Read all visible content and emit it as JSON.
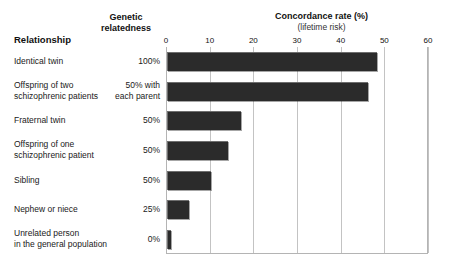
{
  "headers": {
    "relationship": "Relationship",
    "genetic_line1": "Genetic",
    "genetic_line2": "relatedness",
    "concordance_title": "Concordance rate (%)",
    "concordance_sub": "(lifetime risk)"
  },
  "axis": {
    "ticks": [
      "0",
      "10",
      "20",
      "30",
      "40",
      "50",
      "60"
    ],
    "min": 0,
    "max": 60
  },
  "rows": [
    {
      "label_line1": "Identical twin",
      "label_line2": "",
      "relatedness_line1": "100%",
      "relatedness_line2": "",
      "value": 48
    },
    {
      "label_line1": "Offspring of two",
      "label_line2": "schizophrenic patients",
      "relatedness_line1": "50% with",
      "relatedness_line2": "each parent",
      "value": 46
    },
    {
      "label_line1": "Fraternal twin",
      "label_line2": "",
      "relatedness_line1": "50%",
      "relatedness_line2": "",
      "value": 17
    },
    {
      "label_line1": "Offspring of one",
      "label_line2": "schizophrenic patient",
      "relatedness_line1": "50%",
      "relatedness_line2": "",
      "value": 14
    },
    {
      "label_line1": "Sibling",
      "label_line2": "",
      "relatedness_line1": "50%",
      "relatedness_line2": "",
      "value": 10
    },
    {
      "label_line1": "Nephew or niece",
      "label_line2": "",
      "relatedness_line1": "25%",
      "relatedness_line2": "",
      "value": 5
    },
    {
      "label_line1": "Unrelated person",
      "label_line2": "in the general population",
      "relatedness_line1": "0%",
      "relatedness_line2": "",
      "value": 1
    }
  ],
  "colors": {
    "bar": "#2b2b2b",
    "grid": "#c3c3c3",
    "frame": "#b4b4b4",
    "text": "#1a1a1a",
    "background": "#ffffff"
  },
  "chart_data": {
    "type": "bar",
    "orientation": "horizontal",
    "title": "Concordance rate (%)",
    "subtitle": "(lifetime risk)",
    "xlabel": "Concordance rate (%)",
    "ylabel": "Relationship",
    "xlim": [
      0,
      60
    ],
    "xticks": [
      0,
      10,
      20,
      30,
      40,
      50,
      60
    ],
    "grid": true,
    "legend": "none",
    "categories": [
      "Identical twin",
      "Offspring of two schizophrenic patients",
      "Fraternal twin",
      "Offspring of one schizophrenic patient",
      "Sibling",
      "Nephew or niece",
      "Unrelated person in the general population"
    ],
    "values": [
      48,
      46,
      17,
      14,
      10,
      5,
      1
    ],
    "secondary_column": {
      "name": "Genetic relatedness",
      "values": [
        "100%",
        "50% with each parent",
        "50%",
        "50%",
        "50%",
        "25%",
        "0%"
      ]
    }
  }
}
